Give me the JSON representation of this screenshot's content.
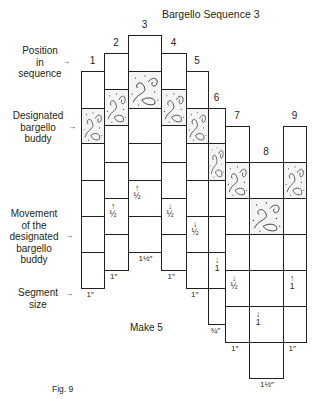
{
  "title": "Bargello Sequence 3",
  "side_labels": {
    "position": [
      "Position",
      "in",
      "sequence"
    ],
    "buddy": [
      "Designated",
      "bargello",
      "buddy"
    ],
    "movement": [
      "Movement",
      "of the",
      "designated",
      "bargello",
      "buddy"
    ],
    "segment": [
      "Segment",
      "size"
    ],
    "arrow": "→"
  },
  "make_label": "Make 5",
  "figure_label": "Fig. 9",
  "pattern_color": "#f4f4f4",
  "line_color": "#231f20",
  "columns": [
    {
      "num": "1",
      "x": 81,
      "w": 23,
      "top": 71,
      "bottom": 288,
      "pattern_top": 108,
      "rows": [
        71,
        108,
        143,
        180,
        216,
        252
      ],
      "movement": {
        "arrow": "",
        "value": ""
      },
      "segment_size": "1″"
    },
    {
      "num": "2",
      "x": 104,
      "w": 24,
      "top": 53,
      "bottom": 270,
      "pattern_top": 89,
      "rows": [
        53,
        89,
        125,
        162,
        198,
        234
      ],
      "movement": {
        "arrow": "↑",
        "value": "½"
      },
      "segment_size": "1″"
    },
    {
      "num": "3",
      "x": 128,
      "w": 33,
      "top": 35,
      "bottom": 252,
      "pattern_top": 71,
      "rows": [
        35,
        71,
        108,
        143,
        180,
        216
      ],
      "movement": {
        "arrow": "↑",
        "value": "½"
      },
      "segment_size": "1½″"
    },
    {
      "num": "4",
      "x": 161,
      "w": 25,
      "top": 53,
      "bottom": 270,
      "pattern_top": 89,
      "rows": [
        53,
        89,
        125,
        162,
        198,
        234
      ],
      "movement": {
        "arrow": "↓",
        "value": "½"
      },
      "segment_size": "1″"
    },
    {
      "num": "5",
      "x": 186,
      "w": 22,
      "top": 71,
      "bottom": 288,
      "pattern_top": 108,
      "rows": [
        71,
        108,
        143,
        180,
        216,
        252
      ],
      "movement": {
        "arrow": "↓",
        "value": "½"
      },
      "segment_size": "1″"
    },
    {
      "num": "6",
      "x": 208,
      "w": 17,
      "top": 108,
      "bottom": 324,
      "pattern_top": 143,
      "rows": [
        108,
        143,
        180,
        216,
        252,
        288
      ],
      "movement": {
        "arrow": "↓",
        "value": "1"
      },
      "segment_size": "¾″"
    },
    {
      "num": "7",
      "x": 225,
      "w": 24,
      "top": 126,
      "bottom": 342,
      "pattern_top": 162,
      "rows": [
        126,
        162,
        198,
        234,
        270,
        306
      ],
      "movement": {
        "arrow": "↓",
        "value": "½"
      },
      "segment_size": "1″"
    },
    {
      "num": "8",
      "x": 249,
      "w": 34,
      "top": 162,
      "bottom": 378,
      "pattern_top": 198,
      "rows": [
        162,
        198,
        234,
        270,
        306,
        342
      ],
      "movement": {
        "arrow": "↓",
        "value": "1"
      },
      "segment_size": "1½″"
    },
    {
      "num": "9",
      "x": 283,
      "w": 23,
      "top": 126,
      "bottom": 342,
      "pattern_top": 162,
      "rows": [
        126,
        162,
        198,
        234,
        270,
        306
      ],
      "movement": {
        "arrow": "↑",
        "value": "1"
      },
      "segment_size": "1″"
    }
  ]
}
